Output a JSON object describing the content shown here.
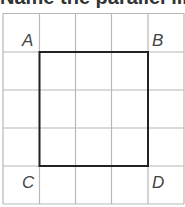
{
  "heading": {
    "text": "Name the parallel line segments"
  },
  "grid": {
    "cols": 5,
    "rows": 5,
    "line_color": "#b5b5b5"
  },
  "square": {
    "stroke_color": "#222222"
  },
  "labels": {
    "A": "A",
    "B": "B",
    "C": "C",
    "D": "D"
  }
}
